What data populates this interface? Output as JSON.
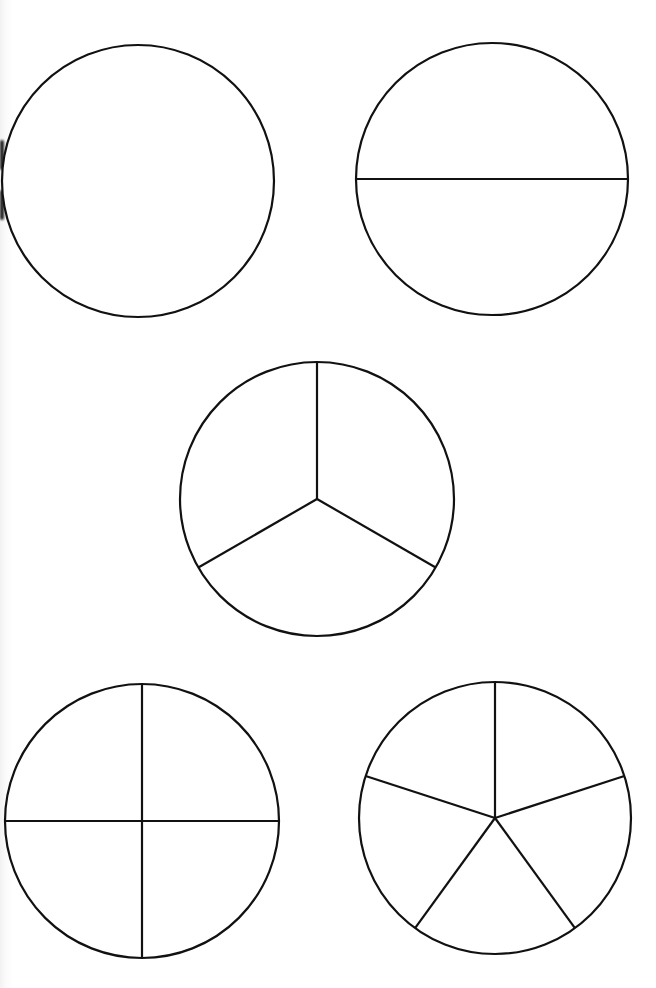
{
  "page": {
    "background": "#ffffff",
    "stroke_color": "#111111",
    "width": 656,
    "height": 988
  },
  "fraction_circles": [
    {
      "id": "whole",
      "parts": 1,
      "cx": 138,
      "cy": 181,
      "r": 136,
      "start_angle_deg": -90
    },
    {
      "id": "halves",
      "parts": 2,
      "cx": 492,
      "cy": 179,
      "r": 136,
      "start_angle_deg": 0
    },
    {
      "id": "thirds",
      "parts": 3,
      "cx": 317,
      "cy": 499,
      "r": 137,
      "start_angle_deg": -90
    },
    {
      "id": "quarters",
      "parts": 4,
      "cx": 142,
      "cy": 821,
      "r": 137,
      "start_angle_deg": -90
    },
    {
      "id": "fifths",
      "parts": 5,
      "cx": 495,
      "cy": 818,
      "r": 136,
      "start_angle_deg": -90
    }
  ]
}
